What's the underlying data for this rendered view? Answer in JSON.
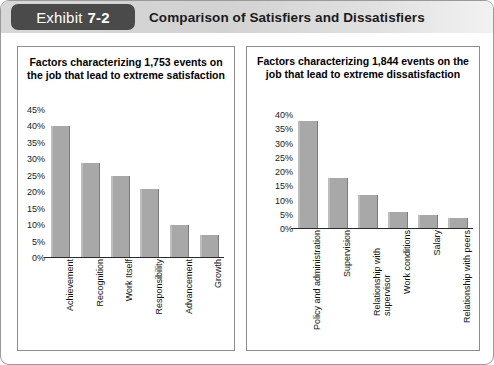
{
  "header": {
    "exhibit_word": "Exhibit",
    "exhibit_number": "7-2",
    "title": "Comparison of Satisfiers and Dissatisfiers"
  },
  "panels": {
    "left": {
      "title": "Factors characterizing 1,753 events on the job that lead to extreme satisfaction"
    },
    "right": {
      "title": "Factors characterizing 1,844 events on the job that lead to extreme dissatisfaction"
    }
  },
  "chart_data": [
    {
      "type": "bar",
      "title": "Factors characterizing 1,753 events on the job that lead to extreme satisfaction",
      "xlabel": "",
      "ylabel": "",
      "ylim": [
        0,
        45
      ],
      "yticks": [
        "45%",
        "40%",
        "35%",
        "30%",
        "25%",
        "20%",
        "15%",
        "10%",
        "5%",
        "0%"
      ],
      "ytick_values": [
        45,
        40,
        35,
        30,
        25,
        20,
        15,
        10,
        5,
        0
      ],
      "grid": false,
      "legend": "none",
      "categories": [
        "Achievement",
        "Recognition",
        "Work Itself",
        "Responsibility",
        "Advancement",
        "Growth"
      ],
      "values": [
        40,
        29,
        25,
        21,
        10,
        7
      ]
    },
    {
      "type": "bar",
      "title": "Factors characterizing 1,844 events on the job that lead to extreme dissatisfaction",
      "xlabel": "",
      "ylabel": "",
      "ylim": [
        0,
        40
      ],
      "yticks": [
        "40%",
        "35%",
        "30%",
        "25%",
        "20%",
        "15%",
        "10%",
        "5%",
        "0%"
      ],
      "ytick_values": [
        40,
        35,
        30,
        25,
        20,
        15,
        10,
        5,
        0
      ],
      "grid": false,
      "legend": "none",
      "categories": [
        "Policy and administration",
        "Supervision",
        "Relationship with supervisor",
        "Work conditions",
        "Salary",
        "Relationship with peers"
      ],
      "values": [
        38,
        18,
        12,
        6,
        5,
        4
      ]
    }
  ],
  "colors": {
    "bar_fill": "#a8a8a8",
    "bar_edge": "#7c7c7c",
    "tag_background": "#4a4a4a",
    "header_background": "#d7d7d7",
    "axis": "#2b2b2b"
  }
}
